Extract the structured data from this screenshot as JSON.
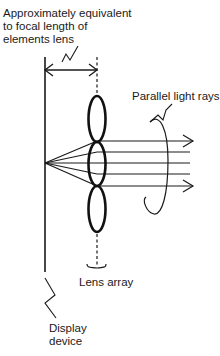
{
  "labels": {
    "focal_length": {
      "lines": [
        "Approximately equivalent",
        "to focal length of",
        "elements lens"
      ]
    },
    "parallel_rays": {
      "text": "Parallel light rays"
    },
    "lens_array": {
      "text": "Lens array"
    },
    "display_device": {
      "lines": [
        "Display",
        "device"
      ]
    }
  },
  "diagram": {
    "stroke_color": "#1a1a1a",
    "display_line": {
      "x": 45,
      "y_top": 57,
      "y_bottom": 272
    },
    "focal_point": {
      "x": 45,
      "y": 163
    },
    "lens_array": {
      "center_x": 97,
      "lenses": [
        {
          "cy": 119,
          "rx": 9,
          "ry": 23
        },
        {
          "cy": 164,
          "rx": 9,
          "ry": 22
        },
        {
          "cy": 209,
          "rx": 9,
          "ry": 23
        }
      ]
    },
    "rays_y": [
      141,
      152,
      163,
      174,
      186
    ],
    "arrow_tip_x": 193
  }
}
